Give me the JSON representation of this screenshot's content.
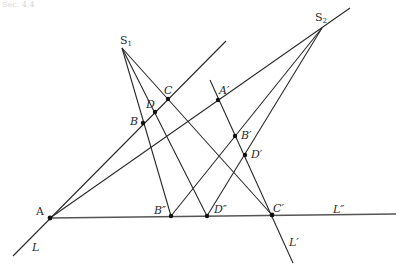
{
  "diagram": {
    "header_fragment": "Sec. 4.4",
    "lines": [
      {
        "id": "L",
        "label": "L"
      },
      {
        "id": "Lp",
        "label": "L′"
      },
      {
        "id": "Lpp",
        "label": "L″"
      }
    ],
    "centers": [
      {
        "id": "S1",
        "base": "S",
        "sub": "1"
      },
      {
        "id": "S2",
        "base": "S",
        "sub": "2"
      }
    ],
    "points": [
      {
        "id": "A",
        "label": "A"
      },
      {
        "id": "B",
        "label": "B"
      },
      {
        "id": "C",
        "label": "C"
      },
      {
        "id": "D",
        "label": "D"
      },
      {
        "id": "Ap",
        "label": "A′"
      },
      {
        "id": "Bp",
        "label": "B′"
      },
      {
        "id": "Cp",
        "label": "C′"
      },
      {
        "id": "Dp",
        "label": "D′"
      },
      {
        "id": "Bpp",
        "label": "B″"
      },
      {
        "id": "Dpp",
        "label": "D″"
      }
    ],
    "colors": {
      "ink": "#2a2a2a",
      "baseline": "#555555"
    }
  }
}
